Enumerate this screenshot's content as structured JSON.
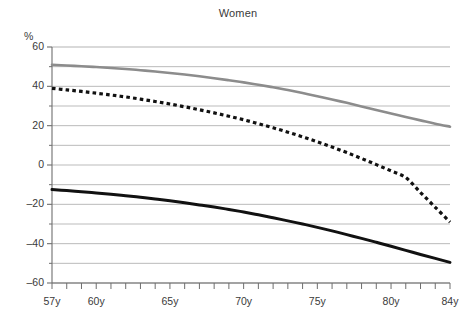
{
  "chart_data": {
    "type": "line",
    "title": "Women",
    "xlabel": "",
    "ylabel": "%",
    "ylim": [
      -60,
      60
    ],
    "xlim": [
      57,
      84
    ],
    "grid": true,
    "grid_step": 10,
    "legend": "none",
    "y_ticks": [
      60,
      40,
      20,
      0,
      -20,
      -40,
      -60
    ],
    "y_tick_labels": [
      "60",
      "40",
      "20",
      "0",
      "–20",
      "–40",
      "–60"
    ],
    "y_minor_ticks": [
      50,
      30,
      10,
      -10,
      -30,
      -50
    ],
    "x_ticks": [
      57,
      58,
      59,
      60,
      61,
      62,
      63,
      64,
      65,
      66,
      67,
      68,
      69,
      70,
      71,
      72,
      73,
      74,
      75,
      76,
      77,
      78,
      79,
      80,
      81,
      82,
      83,
      84
    ],
    "x_tick_labels": [
      {
        "x": 57,
        "label": "57y"
      },
      {
        "x": 60,
        "label": "60y"
      },
      {
        "x": 65,
        "label": "65y"
      },
      {
        "x": 70,
        "label": "70y"
      },
      {
        "x": 75,
        "label": "75y"
      },
      {
        "x": 80,
        "label": "80y"
      },
      {
        "x": 84,
        "label": "84y"
      }
    ],
    "x": [
      57,
      58,
      59,
      60,
      61,
      62,
      63,
      64,
      65,
      66,
      67,
      68,
      69,
      70,
      71,
      72,
      73,
      74,
      75,
      76,
      77,
      78,
      79,
      80,
      81,
      82,
      83,
      84
    ],
    "series": [
      {
        "name": "upper-grey-curve",
        "style": "solid",
        "color": "#8c8c8c",
        "width": 2.6,
        "values": [
          51.0,
          50.6,
          50.2,
          49.8,
          49.3,
          48.8,
          48.2,
          47.5,
          46.8,
          46.0,
          45.1,
          44.1,
          43.1,
          42.0,
          40.8,
          39.5,
          38.1,
          36.6,
          35.0,
          33.3,
          31.6,
          29.8,
          28.0,
          26.2,
          24.4,
          22.7,
          21.0,
          19.5
        ]
      },
      {
        "name": "middle-dotted-curve",
        "style": "dotted",
        "color": "#111111",
        "width": 3.2,
        "values": [
          39.0,
          38.2,
          37.4,
          36.5,
          35.6,
          34.6,
          33.5,
          32.3,
          31.0,
          29.6,
          28.1,
          26.5,
          24.8,
          23.0,
          21.0,
          18.9,
          16.7,
          14.3,
          11.8,
          9.1,
          6.3,
          3.3,
          0.2,
          -3.0,
          -6.4,
          -14.0,
          -21.5,
          -29.0
        ]
      },
      {
        "name": "lower-black-curve",
        "style": "solid",
        "color": "#111111",
        "width": 3.0,
        "values": [
          -12.5,
          -13.0,
          -13.6,
          -14.2,
          -14.9,
          -15.6,
          -16.4,
          -17.3,
          -18.2,
          -19.2,
          -20.3,
          -21.4,
          -22.6,
          -23.9,
          -25.3,
          -26.8,
          -28.4,
          -30.0,
          -31.7,
          -33.5,
          -35.4,
          -37.3,
          -39.3,
          -41.3,
          -43.4,
          -45.5,
          -47.5,
          -49.5
        ]
      }
    ]
  },
  "colors": {
    "grid": "#b3b3b3",
    "axis": "#6e6e6e",
    "text": "#3a3a3a",
    "grey_series": "#8c8c8c",
    "black_series": "#111111"
  }
}
